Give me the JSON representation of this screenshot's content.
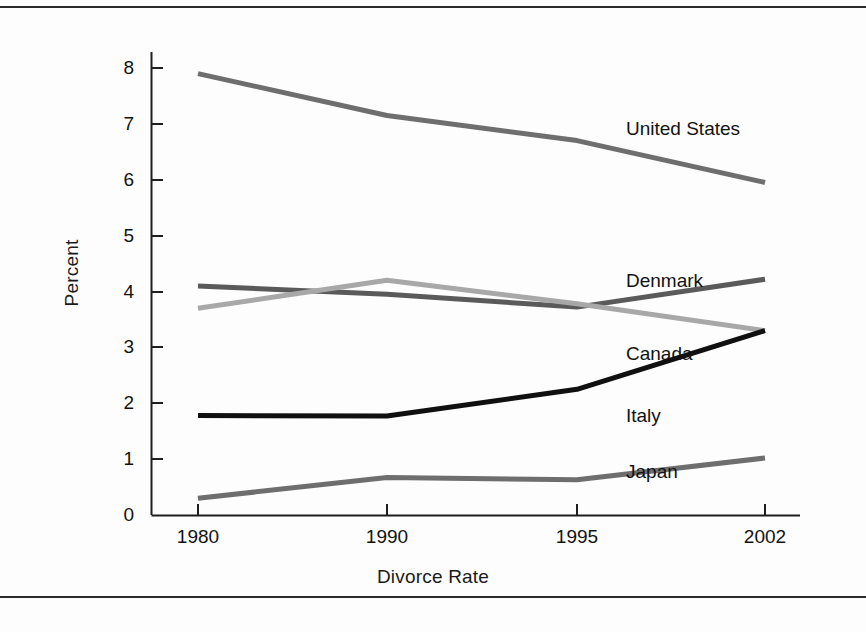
{
  "chart_data": {
    "type": "line",
    "title": "",
    "xlabel": "Divorce Rate",
    "ylabel": "Percent",
    "categories": [
      "1980",
      "1990",
      "1995",
      "2002"
    ],
    "x_tick_labels": [
      "1980",
      "1990",
      "1995",
      "2002"
    ],
    "y_tick_labels": [
      "0",
      "1",
      "2",
      "3",
      "4",
      "5",
      "6",
      "7",
      "8"
    ],
    "ylim": [
      0,
      8
    ],
    "grid": false,
    "legend_position": "inline-right-of-lines",
    "series": [
      {
        "name": "United States",
        "values": [
          7.9,
          7.15,
          6.7,
          5.95
        ],
        "color": "#6e6e6e",
        "label_x": 626,
        "label_y": 119
      },
      {
        "name": "Denmark",
        "values": [
          4.1,
          3.95,
          3.72,
          4.22
        ],
        "color": "#5a5a5a",
        "label_x": 626,
        "label_y": 271
      },
      {
        "name": "Canada",
        "values": [
          3.7,
          4.2,
          3.78,
          3.3
        ],
        "color": "#a8a8a8",
        "label_x": 626,
        "label_y": 344
      },
      {
        "name": "Italy",
        "values": [
          1.78,
          1.77,
          2.25,
          3.3
        ],
        "color": "#101010",
        "label_x": 626,
        "label_y": 406
      },
      {
        "name": "Japan",
        "values": [
          0.3,
          0.67,
          0.63,
          1.02
        ],
        "color": "#6e6e6e",
        "label_x": 626,
        "label_y": 462
      }
    ]
  },
  "axes": {
    "y_title": "Percent",
    "x_title": "Divorce Rate",
    "y_ticks": [
      {
        "label": "8",
        "y": 68
      },
      {
        "label": "7",
        "y": 124
      },
      {
        "label": "6",
        "y": 180
      },
      {
        "label": "5",
        "y": 236
      },
      {
        "label": "4",
        "y": 292
      },
      {
        "label": "3",
        "y": 347
      },
      {
        "label": "2",
        "y": 403
      },
      {
        "label": "1",
        "y": 459
      },
      {
        "label": "0",
        "y": 515
      }
    ],
    "x_ticks": [
      {
        "label": "1980",
        "x": 198
      },
      {
        "label": "1990",
        "x": 387
      },
      {
        "label": "1995",
        "x": 577
      },
      {
        "label": "2002",
        "x": 765
      }
    ]
  },
  "labels": {
    "united_states": "United States",
    "denmark": "Denmark",
    "canada": "Canada",
    "italy": "Italy",
    "japan": "Japan"
  }
}
